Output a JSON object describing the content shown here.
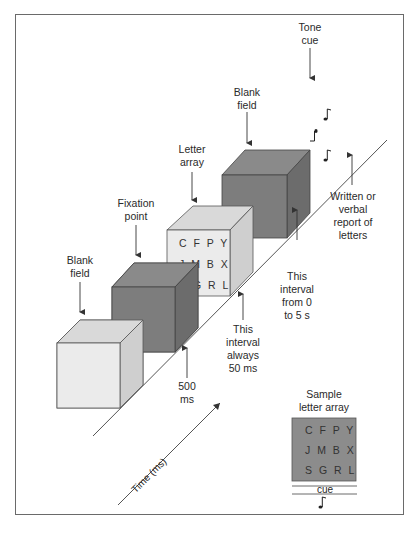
{
  "figure": {
    "colors": {
      "light_box": "#e8e8e8",
      "light_box_top": "#d9d9d9",
      "light_box_side": "#cfcfcf",
      "dark_box": "#7d7d7d",
      "dark_box_top": "#8a8a8a",
      "dark_box_side": "#6c6c6c",
      "letter_box": "#ebebeb",
      "sample_array": "#8c8c8c",
      "line": "#555555",
      "frame": "#6a6a6a"
    },
    "stages": [
      {
        "id": "blank-field-1",
        "label_line1": "Blank",
        "label_line2": "field",
        "shade": "light"
      },
      {
        "id": "fixation-point",
        "label_line1": "Fixation",
        "label_line2": "point",
        "shade": "dark"
      },
      {
        "id": "letter-array",
        "label_line1": "Letter",
        "label_line2": "array",
        "shade": "light",
        "rows": [
          "C F P Y",
          "J M B X",
          "S G R L"
        ]
      },
      {
        "id": "blank-field-2",
        "label_line1": "Blank",
        "label_line2": "field",
        "shade": "dark"
      }
    ],
    "tone_cue": {
      "line1": "Tone",
      "line2": "cue",
      "notes": 3
    },
    "intervals": {
      "fixation": {
        "line1": "500",
        "line2": "ms"
      },
      "array": {
        "line1": "This",
        "line2": "interval",
        "line3": "always",
        "line4": "50 ms"
      },
      "delay": {
        "line1": "This",
        "line2": "interval",
        "line3": "from 0",
        "line4": "to 5 s"
      }
    },
    "response": {
      "line1": "Written or",
      "line2": "verbal",
      "line3": "report of",
      "line4": "letters"
    },
    "time_axis": {
      "label": "Time (ms)"
    },
    "sample": {
      "title_line1": "Sample",
      "title_line2": "letter array",
      "rows": [
        "C F P Y",
        "J M B X",
        "S G R L"
      ],
      "cue_label": "cue"
    }
  }
}
